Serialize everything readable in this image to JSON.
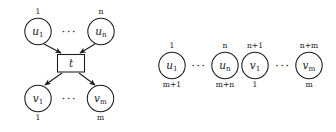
{
  "figure": {
    "background_color": "#ffffff",
    "ink_color": "#1a1a1a",
    "ellipsis": "···"
  },
  "left_diagram": {
    "name": "transition-with-input-and-output-places",
    "transition": {
      "label": "t"
    },
    "input_places": [
      {
        "label_base": "u",
        "label_sub": "1",
        "top_index": "1",
        "bottom_index": ""
      },
      {
        "label_base": "u",
        "label_sub": "n",
        "top_index": "n",
        "bottom_index": ""
      }
    ],
    "output_places": [
      {
        "label_base": "v",
        "label_sub": "1",
        "top_index": "",
        "bottom_index": "1"
      },
      {
        "label_base": "v",
        "label_sub": "m",
        "top_index": "",
        "bottom_index": "m"
      }
    ],
    "edges": [
      {
        "from": "u_1",
        "to": "t",
        "direction": "down"
      },
      {
        "from": "u_n",
        "to": "t",
        "direction": "down"
      },
      {
        "from": "t",
        "to": "v_1",
        "direction": "down"
      },
      {
        "from": "t",
        "to": "v_m",
        "direction": "down"
      }
    ]
  },
  "right_diagram": {
    "name": "linearized-place-sequence",
    "places": [
      {
        "label_base": "u",
        "label_sub": "1",
        "top_index": "1",
        "bottom_index": "m+1"
      },
      {
        "label_base": "u",
        "label_sub": "n",
        "top_index": "n",
        "bottom_index": "m+n"
      },
      {
        "label_base": "v",
        "label_sub": "1",
        "top_index": "n+1",
        "bottom_index": "1"
      },
      {
        "label_base": "v",
        "label_sub": "m",
        "top_index": "n+m",
        "bottom_index": "m"
      }
    ]
  }
}
